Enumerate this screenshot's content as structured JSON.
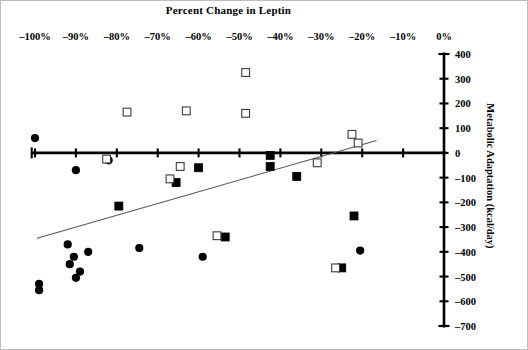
{
  "figure": {
    "width": 528,
    "height": 350,
    "background": "#ffffff",
    "border_color": "#bdbdbd"
  },
  "chart_data": {
    "type": "scatter",
    "title": "Percent Change in Leptin",
    "xlabel": "Percent Change in Leptin",
    "ylabel": "Metabolic Adaptation (kcal/day)",
    "xlim": [
      -105,
      0
    ],
    "ylim": [
      -700,
      400
    ],
    "x_axis_position": "top",
    "y_axis_position": "right",
    "grid": false,
    "legend": "none",
    "x_ticks": [
      -100,
      -90,
      -80,
      -70,
      -60,
      -50,
      -40,
      -30,
      -20,
      -10,
      0
    ],
    "x_tick_labels": [
      "–100%",
      "–90%",
      "–80%",
      "–70%",
      "–60%",
      "–50%",
      "–40%",
      "–30%",
      "–20%",
      "–10%",
      "0%"
    ],
    "y_ticks": [
      400,
      300,
      200,
      100,
      0,
      -100,
      -200,
      -300,
      -400,
      -500,
      -600,
      -700
    ],
    "y_tick_labels": [
      "400",
      "300",
      "200",
      "100",
      "0",
      "–100",
      "–200",
      "–300",
      "–400",
      "–500",
      "–600",
      "–700"
    ],
    "zero_line_y": 0,
    "trendline": {
      "x_start": -99.5,
      "y_start": -345,
      "x_end": -16.5,
      "y_end": 50,
      "color": "#555555"
    },
    "series": [
      {
        "name": "filled-circle",
        "marker": "filled-circle",
        "color": "#000000",
        "points": [
          {
            "x": -100.0,
            "y": 60
          },
          {
            "x": -90.0,
            "y": -70
          },
          {
            "x": -82.0,
            "y": -30
          },
          {
            "x": -92.0,
            "y": -370
          },
          {
            "x": -90.5,
            "y": -420
          },
          {
            "x": -91.5,
            "y": -450
          },
          {
            "x": -89.0,
            "y": -480
          },
          {
            "x": -87.0,
            "y": -400
          },
          {
            "x": -99.0,
            "y": -530
          },
          {
            "x": -99.0,
            "y": -555
          },
          {
            "x": -90.0,
            "y": -505
          },
          {
            "x": -74.5,
            "y": -385
          },
          {
            "x": -59.0,
            "y": -420
          },
          {
            "x": -20.5,
            "y": -395
          }
        ]
      },
      {
        "name": "filled-square",
        "marker": "filled-square",
        "color": "#000000",
        "points": [
          {
            "x": -79.5,
            "y": -215
          },
          {
            "x": -65.5,
            "y": -120
          },
          {
            "x": -60.0,
            "y": -60
          },
          {
            "x": -53.5,
            "y": -340
          },
          {
            "x": -42.5,
            "y": -10
          },
          {
            "x": -42.5,
            "y": -55
          },
          {
            "x": -36.0,
            "y": -95
          },
          {
            "x": -22.0,
            "y": -255
          },
          {
            "x": -25.0,
            "y": -465
          }
        ]
      },
      {
        "name": "open-square",
        "marker": "open-square",
        "color": "#ffffff",
        "points": [
          {
            "x": -82.5,
            "y": -25
          },
          {
            "x": -77.5,
            "y": 165
          },
          {
            "x": -67.0,
            "y": -105
          },
          {
            "x": -64.5,
            "y": -55
          },
          {
            "x": -63.0,
            "y": 170
          },
          {
            "x": -55.5,
            "y": -335
          },
          {
            "x": -48.5,
            "y": 325
          },
          {
            "x": -48.5,
            "y": 160
          },
          {
            "x": -31.0,
            "y": -40
          },
          {
            "x": -22.5,
            "y": 75
          },
          {
            "x": -21.0,
            "y": 40
          },
          {
            "x": -26.5,
            "y": -465
          }
        ]
      }
    ]
  }
}
